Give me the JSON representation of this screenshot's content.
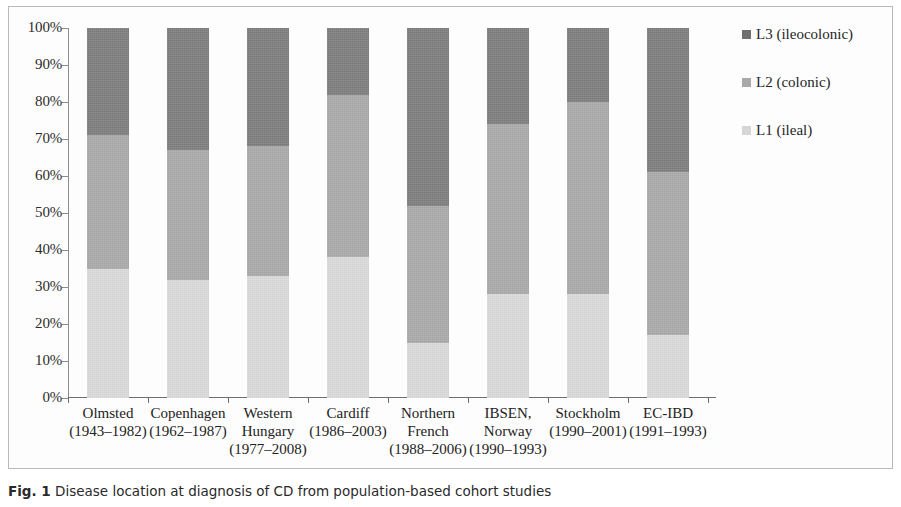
{
  "chart_data": {
    "type": "bar",
    "subtype": "stacked-100-percent",
    "title": "",
    "xlabel": "",
    "ylabel": "",
    "ylim": [
      0,
      100
    ],
    "yticks": [
      0,
      10,
      20,
      30,
      40,
      50,
      60,
      70,
      80,
      90,
      100
    ],
    "ytick_labels": [
      "0%",
      "10%",
      "20%",
      "30%",
      "40%",
      "50%",
      "60%",
      "70%",
      "80%",
      "90%",
      "100%"
    ],
    "grid": false,
    "legend_position": "right",
    "stack_order_bottom_to_top": [
      "L1 (ileal)",
      "L2 (colonic)",
      "L3 (ileocolonic)"
    ],
    "categories": [
      "Olmsted (1943–1982)",
      "Copenhagen (1962–1987)",
      "Western Hungary (1977–2008)",
      "Cardiff (1986–2003)",
      "Northern French (1988–2006)",
      "IBSEN, Norway (1990–1993)",
      "Stockholm (1990–2001)",
      "EC-IBD (1991–1993)"
    ],
    "category_parts": [
      {
        "name": "Olmsted",
        "years": "(1943–1982)"
      },
      {
        "name": "Copenhagen",
        "years": "(1962–1987)"
      },
      {
        "name": "Western",
        "name2": "Hungary",
        "years": "(1977–2008)"
      },
      {
        "name": "Cardiff",
        "years": "(1986–2003)"
      },
      {
        "name": "Northern",
        "name2": "French",
        "years": "(1988–2006)"
      },
      {
        "name": "IBSEN,",
        "name2": "Norway",
        "years": "(1990–1993)"
      },
      {
        "name": "Stockholm",
        "years": "(1990–2001)"
      },
      {
        "name": "EC-IBD",
        "years": "(1991–1993)"
      }
    ],
    "series": [
      {
        "name": "L1 (ileal)",
        "color": "#dadada",
        "values": [
          35,
          32,
          33,
          38,
          15,
          28,
          28,
          17
        ]
      },
      {
        "name": "L2 (colonic)",
        "color": "#a9a9a9",
        "values": [
          36,
          35,
          35,
          44,
          37,
          46,
          52,
          44
        ]
      },
      {
        "name": "L3 (ileocolonic)",
        "color": "#7d7d7d",
        "values": [
          29,
          33,
          32,
          18,
          48,
          26,
          20,
          39
        ]
      }
    ],
    "cumulative_tops": {
      "L1": [
        35,
        32,
        33,
        38,
        15,
        28,
        28,
        17
      ],
      "L2": [
        71,
        67,
        68,
        82,
        52,
        74,
        80,
        61
      ],
      "L3": [
        100,
        100,
        100,
        100,
        100,
        100,
        100,
        100
      ]
    }
  },
  "legend": {
    "items": [
      {
        "label": "L3 (ileocolonic)",
        "swatch": "#6f6f6f",
        "icon": "legend-swatch-icon"
      },
      {
        "label": "L2 (colonic)",
        "swatch": "#a9a9a9",
        "icon": "legend-swatch-icon"
      },
      {
        "label": "L1 (ileal)",
        "swatch": "#d6d6d6",
        "icon": "legend-swatch-icon"
      }
    ]
  },
  "caption": {
    "figure_number": "Fig. 1",
    "text": "Disease location at diagnosis of CD from population-based cohort studies"
  }
}
